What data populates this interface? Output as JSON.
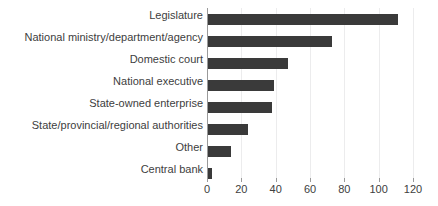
{
  "chart_data": {
    "type": "bar",
    "orientation": "horizontal",
    "title": "",
    "subtitle": "",
    "xlabel": "",
    "ylabel": "",
    "xlim": [
      0,
      120
    ],
    "xticks": [
      0,
      20,
      40,
      60,
      80,
      100,
      120
    ],
    "xtick_labels": [
      "0",
      "20",
      "40",
      "60",
      "80",
      "100",
      "120"
    ],
    "grid": true,
    "grid_axis": "x",
    "legend": false,
    "legend_position": "none",
    "categories": [
      "Legislature",
      "National ministry/department/agency",
      "Domestic court",
      "National executive",
      "State-owned enterprise",
      "State/provincial/regional authorities",
      "Other",
      "Central bank"
    ],
    "values": [
      111,
      73,
      47,
      39,
      38,
      24,
      14,
      3
    ],
    "bar_color": "#3a3a3a",
    "grid_color": "#ececed",
    "axis_color": "#9a9a9a",
    "text_color": "#404040"
  }
}
